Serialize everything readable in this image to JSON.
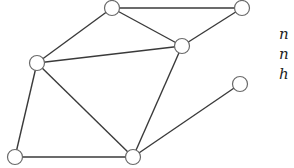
{
  "graph": {
    "node_radius": 7.5,
    "nodes": [
      {
        "id": "top",
        "x": 112,
        "y": 8
      },
      {
        "id": "top-right",
        "x": 242,
        "y": 8
      },
      {
        "id": "mid-right",
        "x": 182,
        "y": 46
      },
      {
        "id": "left",
        "x": 37,
        "y": 63
      },
      {
        "id": "right-lower",
        "x": 240,
        "y": 84
      },
      {
        "id": "bottom-left",
        "x": 15,
        "y": 157
      },
      {
        "id": "bottom-mid",
        "x": 133,
        "y": 157
      }
    ],
    "edges": [
      [
        "top",
        "top-right"
      ],
      [
        "top",
        "mid-right"
      ],
      [
        "top-right",
        "mid-right"
      ],
      [
        "top",
        "left"
      ],
      [
        "left",
        "mid-right"
      ],
      [
        "left",
        "bottom-left"
      ],
      [
        "left",
        "bottom-mid"
      ],
      [
        "bottom-left",
        "bottom-mid"
      ],
      [
        "mid-right",
        "bottom-mid"
      ],
      [
        "bottom-mid",
        "right-lower"
      ]
    ]
  },
  "side_text": {
    "lines": [
      "n",
      "n",
      "h"
    ]
  }
}
